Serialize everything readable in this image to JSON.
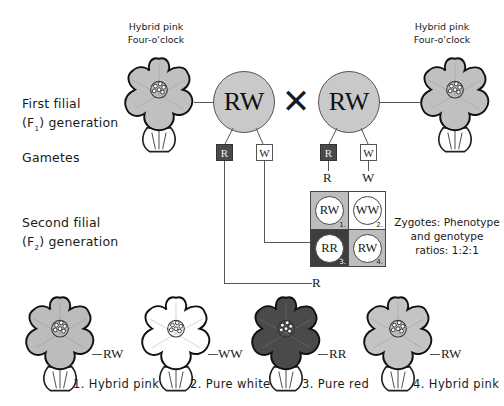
{
  "parents": {
    "left_flower_label": [
      "Hybrid pink",
      "Four-o'clock"
    ],
    "right_flower_label": [
      "Hybrid pink",
      "Four-o'clock"
    ],
    "left_genotype": "RW",
    "right_genotype": "RW",
    "cross_symbol": "✕"
  },
  "row_labels": {
    "f1": [
      "First filial",
      "(F",
      "1",
      ") generation"
    ],
    "gametes": "Gametes",
    "f2": [
      "Second filial",
      "(F",
      "2",
      ") generation"
    ]
  },
  "gametes": {
    "left": [
      "R",
      "W"
    ],
    "right": [
      "R",
      "W"
    ],
    "column_headers": [
      "R",
      "W"
    ],
    "row_headers": [
      "W",
      "R"
    ]
  },
  "punnett": [
    {
      "genotype": "RW",
      "number": "1.",
      "bg": "#bdbdbd"
    },
    {
      "genotype": "WW",
      "number": "2.",
      "bg": "#ffffff"
    },
    {
      "genotype": "RR",
      "number": "3.",
      "bg": "#3d3d3d"
    },
    {
      "genotype": "RW",
      "number": "4.",
      "bg": "#bdbdbd"
    }
  ],
  "zygotes_note": [
    "Zygotes: Phenotype",
    "and genotype",
    "ratios: 1:2:1"
  ],
  "offspring": [
    {
      "genotype": "RW",
      "caption": "1. Hybrid pink",
      "petal": "#bcbcbc"
    },
    {
      "genotype": "WW",
      "caption": "2. Pure white",
      "petal": "#ffffff"
    },
    {
      "genotype": "RR",
      "caption": "3. Pure red",
      "petal": "#4a4a4a"
    },
    {
      "genotype": "RW",
      "caption": "4. Hybrid pink",
      "petal": "#c4c4c4"
    }
  ],
  "colors": {
    "pink_gray": "#c9c9c9",
    "red_dark": "#4a4a4a",
    "white": "#ffffff",
    "line": "#555555"
  }
}
